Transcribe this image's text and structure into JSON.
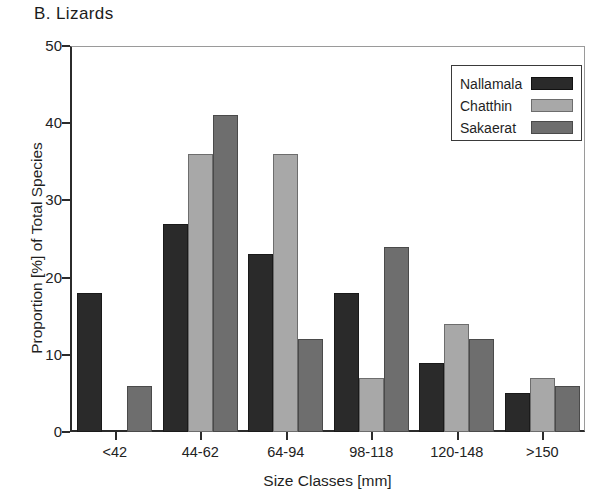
{
  "panel": {
    "label": "B.  Lizards"
  },
  "chart_data": {
    "type": "bar",
    "title": "B.  Lizards",
    "xlabel": "Size Classes [mm]",
    "ylabel": "Proportion [%] of Total Species",
    "categories": [
      "<42",
      "44-62",
      "64-94",
      "98-118",
      "120-148",
      ">150"
    ],
    "ylim": [
      0,
      50
    ],
    "yticks": [
      0,
      10,
      20,
      30,
      40,
      50
    ],
    "ytick_labels": [
      "0",
      "10",
      "20",
      "30",
      "40",
      "50"
    ],
    "grid": false,
    "legend_position": "top-right",
    "series": [
      {
        "name": "Nallamala",
        "color": "#2a2a2a",
        "values": [
          18,
          27,
          23,
          18,
          9,
          5
        ]
      },
      {
        "name": "Chatthin",
        "color": "#a8a8a8",
        "values": [
          0,
          36,
          36,
          7,
          14,
          7
        ]
      },
      {
        "name": "Sakaerat",
        "color": "#6e6e6e",
        "values": [
          6,
          41,
          12,
          24,
          12,
          6
        ]
      }
    ]
  }
}
